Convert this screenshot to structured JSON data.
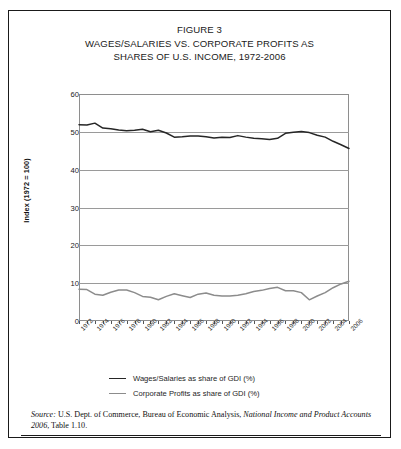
{
  "figure": {
    "title_lines": [
      "FIGURE 3",
      "WAGES/SALARIES VS. CORPORATE PROFITS AS",
      "SHARES OF U.S. INCOME, 1972-2006"
    ],
    "source_prefix": "Source:",
    "source_text_1": " U.S. Dept. of Commerce, Bureau of Economic Analysis, ",
    "source_italic": "National Income and Product Accounts 2006",
    "source_text_2": ", Table 1.10."
  },
  "chart_data": {
    "type": "line",
    "title": "FIGURE 3 WAGES/SALARIES VS. CORPORATE PROFITS AS SHARES OF U.S. INCOME, 1972-2006",
    "xlabel": "",
    "ylabel": "Index (1972 = 100)",
    "ylim": [
      0,
      60
    ],
    "yticks": [
      0,
      10,
      20,
      30,
      40,
      50,
      60
    ],
    "xlim": [
      1972,
      2006
    ],
    "xticks": [
      1972,
      1974,
      1976,
      1978,
      1980,
      1982,
      1984,
      1986,
      1988,
      1990,
      1992,
      1994,
      1996,
      1998,
      2000,
      2002,
      2004,
      2006
    ],
    "xtick_labels": [
      "1972",
      "1974",
      "1976",
      "1978",
      "1980",
      "1982",
      "1984",
      "1986",
      "1988",
      "1990",
      "1992",
      "1994",
      "1996",
      "1998",
      "2000",
      "2002",
      "2004",
      "2006"
    ],
    "grid": "horizontal",
    "legend_position": "below",
    "x": [
      1972,
      1973,
      1974,
      1975,
      1976,
      1977,
      1978,
      1979,
      1980,
      1981,
      1982,
      1983,
      1984,
      1985,
      1986,
      1987,
      1988,
      1989,
      1990,
      1991,
      1992,
      1993,
      1994,
      1995,
      1996,
      1997,
      1998,
      1999,
      2000,
      2001,
      2002,
      2003,
      2004,
      2005,
      2006
    ],
    "series": [
      {
        "name": "Wages/Salaries as share of GDI (%)",
        "color": "#262626",
        "values": [
          51.9,
          51.8,
          52.3,
          51.0,
          50.8,
          50.5,
          50.3,
          50.4,
          50.7,
          50.0,
          50.4,
          49.7,
          48.6,
          48.7,
          48.9,
          48.9,
          48.7,
          48.4,
          48.6,
          48.5,
          49.0,
          48.6,
          48.3,
          48.2,
          48.0,
          48.3,
          49.6,
          49.9,
          50.1,
          49.8,
          49.1,
          48.6,
          47.5,
          46.6,
          45.6
        ]
      },
      {
        "name": "Corporate Profits as share of GDI (%)",
        "color": "#8c8c8c",
        "values": [
          8.4,
          8.3,
          7.1,
          6.8,
          7.6,
          8.2,
          8.2,
          7.5,
          6.5,
          6.3,
          5.6,
          6.5,
          7.2,
          6.7,
          6.2,
          7.1,
          7.4,
          6.8,
          6.6,
          6.6,
          6.8,
          7.2,
          7.8,
          8.1,
          8.6,
          8.9,
          8.0,
          8.0,
          7.5,
          5.6,
          6.6,
          7.5,
          8.8,
          9.8,
          10.5
        ]
      }
    ],
    "legend": [
      {
        "label": "Wages/Salaries as share of GDI (%)",
        "color": "#262626"
      },
      {
        "label": "Corporate Profits as share of GDI (%)",
        "color": "#8c8c8c"
      }
    ]
  }
}
